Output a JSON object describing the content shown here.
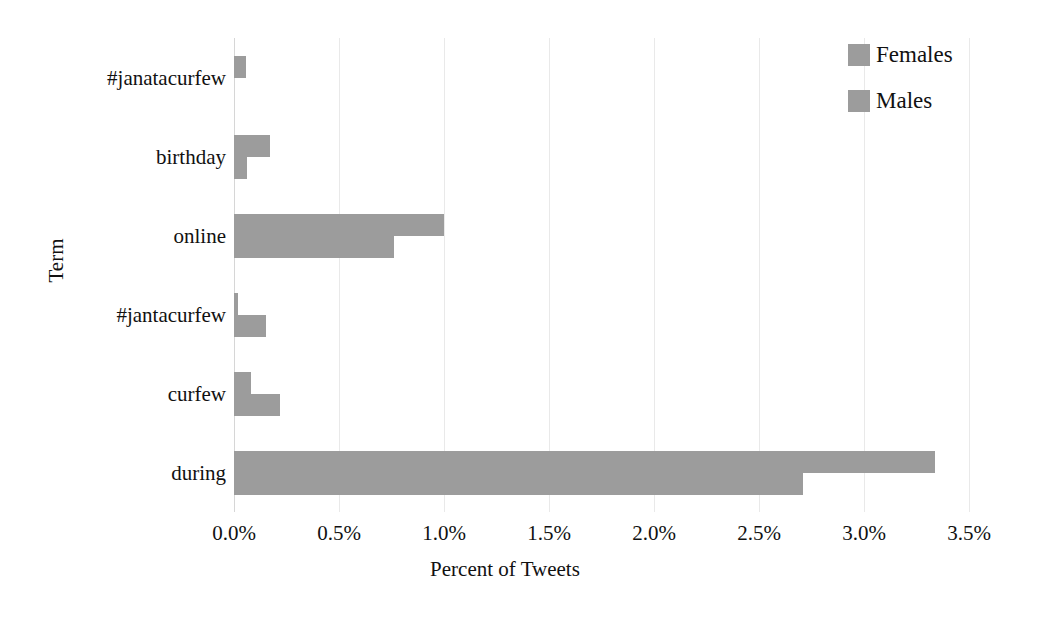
{
  "chart_data": {
    "type": "bar",
    "orientation": "horizontal",
    "title": "",
    "xlabel": "Percent of Tweets",
    "ylabel": "Term",
    "categories": [
      "#janatacurfew",
      "birthday",
      "online",
      "#jantacurfew",
      "curfew",
      "during"
    ],
    "series": [
      {
        "name": "Females",
        "values": [
          0.055,
          0.17,
          1.0,
          0.02,
          0.08,
          3.34
        ]
      },
      {
        "name": "Males",
        "values": [
          0.0,
          0.06,
          0.76,
          0.15,
          0.22,
          2.71
        ]
      }
    ],
    "xlim": [
      0.0,
      3.5
    ],
    "xticks": [
      0.0,
      0.5,
      1.0,
      1.5,
      2.0,
      2.5,
      3.0,
      3.5
    ],
    "xtick_labels": [
      "0.0%",
      "0.5%",
      "1.0%",
      "1.5%",
      "2.0%",
      "2.5%",
      "3.0%",
      "3.5%"
    ],
    "grid": true,
    "grid_axis": "x",
    "legend_position": "top-right",
    "bar_color": "#9c9c9c"
  },
  "legend": {
    "entries": [
      {
        "label": "Females",
        "color": "#9c9c9c"
      },
      {
        "label": "Males",
        "color": "#9c9c9c"
      }
    ]
  },
  "axes": {
    "x_title": "Percent of Tweets",
    "y_title": "Term"
  }
}
